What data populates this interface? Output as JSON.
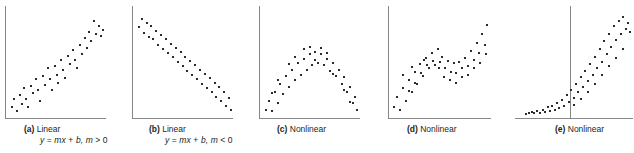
{
  "figure": {
    "width": 634,
    "height": 153,
    "background": "#ffffff",
    "axis_color": "#868686",
    "point_color": "#2b2b2b",
    "caption_color": "#231f20"
  },
  "panels": [
    {
      "key": "a",
      "letter": "(a)",
      "label": "Linear",
      "formula": "y = mx + b, m > 0",
      "formula_parts": {
        "lhs": "y",
        "eq": "=",
        "rhs": "mx",
        "plus": "+",
        "b": "b,",
        "m": "m",
        "rel": ">",
        "zero": "0"
      },
      "caption_has_formula": true,
      "axis_v_x": 5,
      "axis_h_y": 118,
      "left": 0,
      "width": 110,
      "plot_left": 5,
      "plot_right": 106,
      "plot_top": 6,
      "plot_bottom": 118,
      "caption_left": 24,
      "caption_top": 124
    },
    {
      "key": "b",
      "letter": "(b)",
      "label": "Linear",
      "formula": "y = mx + b, m < 0",
      "formula_parts": {
        "lhs": "y",
        "eq": "=",
        "rhs": "mx",
        "plus": "+",
        "b": "b,",
        "m": "m",
        "rel": "<",
        "zero": "0"
      },
      "caption_has_formula": true,
      "axis_v_x": 5,
      "axis_h_y": 118,
      "left": 127,
      "width": 110,
      "plot_left": 5,
      "plot_right": 106,
      "plot_top": 6,
      "plot_bottom": 118,
      "caption_left": 22,
      "caption_top": 124
    },
    {
      "key": "c",
      "letter": "(c)",
      "label": "Nonlinear",
      "formula": "",
      "caption_has_formula": false,
      "axis_v_x": 5,
      "axis_h_y": 118,
      "left": 254,
      "width": 110,
      "plot_left": 5,
      "plot_right": 106,
      "plot_top": 6,
      "plot_bottom": 118,
      "caption_left": 23,
      "caption_top": 124
    },
    {
      "key": "d",
      "letter": "(d)",
      "label": "Nonlinear",
      "formula": "",
      "caption_has_formula": false,
      "axis_v_x": 5,
      "axis_h_y": 118,
      "left": 383,
      "width": 112,
      "plot_left": 5,
      "plot_right": 108,
      "plot_top": 6,
      "plot_bottom": 118,
      "caption_left": 24,
      "caption_top": 124
    },
    {
      "key": "e",
      "letter": "(e)",
      "label": "Nonlinear",
      "formula": "",
      "caption_has_formula": false,
      "axis_v_x": 55,
      "axis_h_y": 118,
      "left": 515,
      "width": 119,
      "plot_left": 0,
      "plot_right": 118,
      "plot_top": 6,
      "plot_bottom": 118,
      "caption_left": 40,
      "caption_top": 124
    }
  ],
  "chart_data": [
    {
      "type": "scatter",
      "panel": "a",
      "title": "(a) Linear",
      "annotations": [
        "y = mx + b, m > 0"
      ],
      "pattern": "positive linear",
      "xlabel": "",
      "ylabel": "",
      "grid": false,
      "legend": "none",
      "xlim": [
        0,
        100
      ],
      "ylim": [
        0,
        100
      ],
      "points": [
        [
          4,
          8
        ],
        [
          6,
          16
        ],
        [
          9,
          5
        ],
        [
          12,
          19
        ],
        [
          14,
          11
        ],
        [
          17,
          26
        ],
        [
          19,
          16
        ],
        [
          21,
          8
        ],
        [
          24,
          28
        ],
        [
          26,
          21
        ],
        [
          29,
          34
        ],
        [
          31,
          24
        ],
        [
          33,
          14
        ],
        [
          36,
          37
        ],
        [
          38,
          29
        ],
        [
          41,
          44
        ],
        [
          43,
          34
        ],
        [
          45,
          24
        ],
        [
          48,
          46
        ],
        [
          50,
          38
        ],
        [
          52,
          31
        ],
        [
          55,
          52
        ],
        [
          57,
          43
        ],
        [
          59,
          35
        ],
        [
          62,
          56
        ],
        [
          64,
          48
        ],
        [
          67,
          61
        ],
        [
          69,
          52
        ],
        [
          71,
          44
        ],
        [
          74,
          66
        ],
        [
          76,
          57
        ],
        [
          79,
          72
        ],
        [
          81,
          63
        ],
        [
          84,
          78
        ],
        [
          86,
          69
        ],
        [
          89,
          88
        ],
        [
          91,
          76
        ],
        [
          94,
          83
        ],
        [
          96,
          74
        ],
        [
          98,
          80
        ]
      ]
    },
    {
      "type": "scatter",
      "panel": "b",
      "title": "(b) Linear",
      "annotations": [
        "y = mx + b, m < 0"
      ],
      "pattern": "negative linear",
      "xlabel": "",
      "ylabel": "",
      "grid": false,
      "legend": "none",
      "xlim": [
        0,
        100
      ],
      "ylim": [
        0,
        100
      ],
      "points": [
        [
          4,
          82
        ],
        [
          7,
          90
        ],
        [
          9,
          77
        ],
        [
          12,
          86
        ],
        [
          14,
          73
        ],
        [
          17,
          83
        ],
        [
          19,
          71
        ],
        [
          22,
          79
        ],
        [
          24,
          66
        ],
        [
          27,
          75
        ],
        [
          29,
          62
        ],
        [
          32,
          71
        ],
        [
          34,
          58
        ],
        [
          37,
          67
        ],
        [
          39,
          55
        ],
        [
          42,
          63
        ],
        [
          44,
          50
        ],
        [
          47,
          59
        ],
        [
          49,
          46
        ],
        [
          52,
          55
        ],
        [
          54,
          42
        ],
        [
          57,
          51
        ],
        [
          59,
          38
        ],
        [
          62,
          47
        ],
        [
          64,
          34
        ],
        [
          67,
          43
        ],
        [
          69,
          30
        ],
        [
          72,
          39
        ],
        [
          74,
          26
        ],
        [
          77,
          35
        ],
        [
          79,
          22
        ],
        [
          82,
          31
        ],
        [
          84,
          18
        ],
        [
          87,
          27
        ],
        [
          89,
          14
        ],
        [
          92,
          22
        ],
        [
          94,
          9
        ],
        [
          97,
          17
        ],
        [
          99,
          6
        ]
      ]
    },
    {
      "type": "scatter",
      "panel": "c",
      "title": "(c) Nonlinear",
      "annotations": [],
      "pattern": "inverted parabola / concave down",
      "xlabel": "",
      "ylabel": "",
      "grid": false,
      "legend": "none",
      "xlim": [
        0,
        100
      ],
      "ylim": [
        0,
        100
      ],
      "points": [
        [
          4,
          6
        ],
        [
          7,
          14
        ],
        [
          10,
          5
        ],
        [
          13,
          22
        ],
        [
          16,
          12
        ],
        [
          19,
          30
        ],
        [
          22,
          20
        ],
        [
          25,
          37
        ],
        [
          28,
          27
        ],
        [
          31,
          43
        ],
        [
          34,
          33
        ],
        [
          37,
          49
        ],
        [
          40,
          38
        ],
        [
          43,
          53
        ],
        [
          46,
          43
        ],
        [
          49,
          57
        ],
        [
          52,
          47
        ],
        [
          55,
          59
        ],
        [
          58,
          49
        ],
        [
          61,
          57
        ],
        [
          64,
          47
        ],
        [
          67,
          53
        ],
        [
          70,
          42
        ],
        [
          73,
          49
        ],
        [
          76,
          37
        ],
        [
          79,
          43
        ],
        [
          82,
          30
        ],
        [
          85,
          36
        ],
        [
          88,
          22
        ],
        [
          91,
          27
        ],
        [
          94,
          12
        ],
        [
          96,
          18
        ],
        [
          98,
          6
        ],
        [
          43,
          62
        ],
        [
          49,
          64
        ],
        [
          55,
          52
        ],
        [
          61,
          63
        ],
        [
          34,
          55
        ],
        [
          67,
          58
        ],
        [
          28,
          48
        ],
        [
          73,
          39
        ],
        [
          16,
          33
        ],
        [
          85,
          24
        ],
        [
          10,
          21
        ],
        [
          91,
          13
        ]
      ]
    },
    {
      "type": "scatter",
      "panel": "d",
      "title": "(d) Nonlinear",
      "annotations": [],
      "pattern": "cubic / S-shaped wave: rise, plateau-dip, steep rise",
      "xlabel": "",
      "ylabel": "",
      "grid": false,
      "legend": "none",
      "xlim": [
        0,
        100
      ],
      "ylim": [
        0,
        100
      ],
      "points": [
        [
          3,
          8
        ],
        [
          6,
          18
        ],
        [
          9,
          6
        ],
        [
          12,
          26
        ],
        [
          15,
          14
        ],
        [
          18,
          33
        ],
        [
          21,
          22
        ],
        [
          24,
          41
        ],
        [
          26,
          30
        ],
        [
          29,
          48
        ],
        [
          32,
          37
        ],
        [
          35,
          54
        ],
        [
          38,
          44
        ],
        [
          41,
          58
        ],
        [
          44,
          47
        ],
        [
          47,
          62
        ],
        [
          49,
          50
        ],
        [
          52,
          55
        ],
        [
          55,
          44
        ],
        [
          58,
          51
        ],
        [
          61,
          41
        ],
        [
          64,
          49
        ],
        [
          66,
          40
        ],
        [
          69,
          50
        ],
        [
          72,
          44
        ],
        [
          75,
          54
        ],
        [
          78,
          46
        ],
        [
          81,
          60
        ],
        [
          84,
          52
        ],
        [
          87,
          68
        ],
        [
          89,
          58
        ],
        [
          92,
          76
        ],
        [
          95,
          66
        ],
        [
          97,
          84
        ],
        [
          18,
          23
        ],
        [
          24,
          31
        ],
        [
          30,
          40
        ],
        [
          36,
          47
        ],
        [
          42,
          51
        ],
        [
          48,
          44
        ],
        [
          54,
          36
        ],
        [
          60,
          33
        ],
        [
          66,
          31
        ],
        [
          72,
          36
        ],
        [
          78,
          38
        ],
        [
          84,
          44
        ],
        [
          90,
          49
        ],
        [
          96,
          57
        ],
        [
          12,
          38
        ],
        [
          21,
          45
        ],
        [
          33,
          52
        ]
      ]
    },
    {
      "type": "scatter",
      "panel": "e",
      "title": "(e) Nonlinear",
      "annotations": [],
      "pattern": "exponential growth; y-axis drawn mid-panel with flat tail to the left",
      "xlabel": "",
      "ylabel": "",
      "grid": false,
      "legend": "none",
      "xlim": [
        -47,
        100
      ],
      "ylim": [
        0,
        100
      ],
      "points": [
        [
          -34,
          2
        ],
        [
          -30,
          3
        ],
        [
          -27,
          4
        ],
        [
          -24,
          3
        ],
        [
          -20,
          5
        ],
        [
          -17,
          3
        ],
        [
          -13,
          6
        ],
        [
          -10,
          4
        ],
        [
          -7,
          8
        ],
        [
          -4,
          5
        ],
        [
          -1,
          9
        ],
        [
          2,
          6
        ],
        [
          5,
          12
        ],
        [
          8,
          7
        ],
        [
          11,
          15
        ],
        [
          14,
          9
        ],
        [
          17,
          19
        ],
        [
          20,
          13
        ],
        [
          23,
          24
        ],
        [
          26,
          17
        ],
        [
          29,
          30
        ],
        [
          32,
          22
        ],
        [
          35,
          36
        ],
        [
          38,
          27
        ],
        [
          41,
          42
        ],
        [
          44,
          32
        ],
        [
          47,
          48
        ],
        [
          50,
          38
        ],
        [
          53,
          55
        ],
        [
          56,
          44
        ],
        [
          59,
          62
        ],
        [
          62,
          50
        ],
        [
          65,
          69
        ],
        [
          68,
          57
        ],
        [
          71,
          76
        ],
        [
          74,
          64
        ],
        [
          77,
          83
        ],
        [
          80,
          70
        ],
        [
          83,
          88
        ],
        [
          86,
          76
        ],
        [
          89,
          92
        ],
        [
          92,
          81
        ],
        [
          95,
          86
        ],
        [
          98,
          78
        ],
        [
          62,
          38
        ],
        [
          71,
          46
        ],
        [
          80,
          54
        ],
        [
          88,
          62
        ],
        [
          53,
          30
        ],
        [
          44,
          22
        ],
        [
          35,
          16
        ],
        [
          26,
          10
        ]
      ]
    }
  ]
}
